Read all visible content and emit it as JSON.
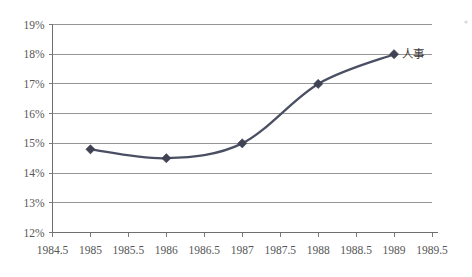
{
  "chart_data": {
    "type": "line",
    "title": "",
    "subtitle": "",
    "xlabel": "",
    "ylabel": "",
    "x": [
      1985,
      1986,
      1987,
      1988,
      1989
    ],
    "series": [
      {
        "name": "人事",
        "values": [
          14.8,
          14.5,
          15.0,
          17.0,
          18.0
        ],
        "marker": "diamond",
        "color": "#4a4f63",
        "smooth": true
      }
    ],
    "xlim": [
      1984.5,
      1989.5
    ],
    "ylim": [
      12,
      19
    ],
    "xticks": [
      1984.5,
      1985,
      1985.5,
      1986,
      1986.5,
      1987,
      1987.5,
      1988,
      1988.5,
      1989,
      1989.5
    ],
    "xtick_labels": [
      "1984.5",
      "1985",
      "1985.5",
      "1986",
      "1986.5",
      "1987",
      "1987.5",
      "1988",
      "1988.5",
      "1989",
      "1989.5"
    ],
    "yticks": [
      12,
      13,
      14,
      15,
      16,
      17,
      18,
      19
    ],
    "ytick_labels": [
      "12%",
      "13%",
      "14%",
      "15%",
      "16%",
      "17%",
      "18%",
      "19%"
    ],
    "grid": "horizontal",
    "legend": "none",
    "annotations": [
      {
        "text": "人事",
        "x": 1989,
        "y": 18.0,
        "placement": "right-of-point"
      }
    ]
  },
  "axis": {
    "y_label_prefix": "",
    "y_unit": "%"
  }
}
